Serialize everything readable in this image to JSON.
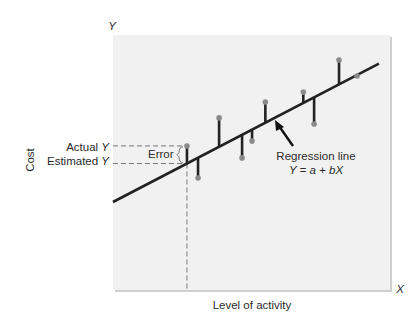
{
  "chart_data": {
    "type": "scatter",
    "title": "",
    "xlabel": "Level of activity",
    "ylabel": "Cost",
    "x_axis_symbol": "X",
    "y_axis_symbol": "Y",
    "xlim": [
      0,
      100
    ],
    "ylim": [
      0,
      100
    ],
    "grid": false,
    "regression_line": {
      "label_line1": "Regression line",
      "label_line2": "Y = a + bX",
      "intercept": 34.5,
      "slope": 0.565,
      "x_start": 0,
      "x_end": 96
    },
    "points": [
      {
        "x": 26.7,
        "y": 56.5
      },
      {
        "x": 30.7,
        "y": 43.9
      },
      {
        "x": 38.3,
        "y": 67.5
      },
      {
        "x": 46.6,
        "y": 51.8
      },
      {
        "x": 50.2,
        "y": 58.4
      },
      {
        "x": 55.0,
        "y": 73.7
      },
      {
        "x": 68.7,
        "y": 77.6
      },
      {
        "x": 72.6,
        "y": 65.1
      },
      {
        "x": 81.6,
        "y": 90.2
      },
      {
        "x": 88.1,
        "y": 83.9
      }
    ],
    "highlight_point_index": 0,
    "annotations": {
      "actual_y": "Actual Y",
      "estimated_y": "Estimated Y",
      "error": "Error"
    }
  },
  "colors": {
    "plot_background": "#f1f1f1",
    "line": "#222222",
    "point": "#8a8a8a",
    "dashed": "#777777",
    "text": "#2b2b2b"
  }
}
